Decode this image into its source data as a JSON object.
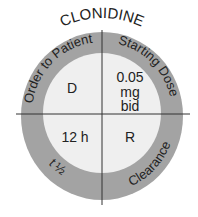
{
  "title": "CLONIDINE",
  "ring_labels": {
    "top_left": "Order to Patient",
    "top_right": "Starting Dose",
    "bottom_left": "t ½",
    "bottom_right": "Clearance"
  },
  "quadrants": {
    "top_left": "D",
    "top_right_line1": "0.05",
    "top_right_line2": "mg",
    "top_right_line3": "bid",
    "bottom_left": "12 h",
    "bottom_right": "R"
  },
  "colors": {
    "ring": "#a3a3a3",
    "inner": "#efefef",
    "lines": "#333333",
    "text": "#222222"
  }
}
